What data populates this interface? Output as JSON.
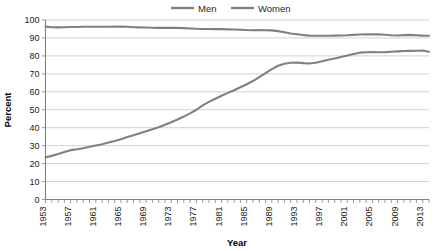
{
  "chart_data": {
    "type": "line",
    "title": "",
    "xlabel": "Year",
    "ylabel": "Percent",
    "xlim": [
      1953,
      2014
    ],
    "ylim": [
      0,
      100
    ],
    "grid": true,
    "legend_position": "top-center",
    "y_ticks": [
      0,
      10,
      20,
      30,
      40,
      50,
      60,
      70,
      80,
      90,
      100
    ],
    "x_tick_labels": [
      "1953",
      "1957",
      "1961",
      "1965",
      "1969",
      "1973",
      "1977",
      "1981",
      "1985",
      "1989",
      "1993",
      "1997",
      "2001",
      "2005",
      "2009",
      "2013"
    ],
    "x_tick_step": 4,
    "x_minor_tick_step": 1,
    "colors": {
      "men": "#808080",
      "women": "#808080",
      "gridline": "#bdbdbd",
      "axis": "#808080",
      "text": "#1a1a1a"
    },
    "x": [
      1953,
      1954,
      1955,
      1956,
      1957,
      1958,
      1959,
      1960,
      1961,
      1962,
      1963,
      1964,
      1965,
      1966,
      1967,
      1968,
      1969,
      1970,
      1971,
      1972,
      1973,
      1974,
      1975,
      1976,
      1977,
      1978,
      1979,
      1980,
      1981,
      1982,
      1983,
      1984,
      1985,
      1986,
      1987,
      1988,
      1989,
      1990,
      1991,
      1992,
      1993,
      1994,
      1995,
      1996,
      1997,
      1998,
      1999,
      2000,
      2001,
      2002,
      2003,
      2004,
      2005,
      2006,
      2007,
      2008,
      2009,
      2010,
      2011,
      2012,
      2013,
      2014
    ],
    "series": [
      {
        "name": "Men",
        "values": [
          96.3,
          96.0,
          95.9,
          96.0,
          96.1,
          96.1,
          96.2,
          96.2,
          96.2,
          96.2,
          96.2,
          96.3,
          96.3,
          96.2,
          96.0,
          95.9,
          95.8,
          95.7,
          95.6,
          95.6,
          95.6,
          95.6,
          95.5,
          95.3,
          95.1,
          95.0,
          95.0,
          94.9,
          94.9,
          94.8,
          94.7,
          94.6,
          94.4,
          94.3,
          94.4,
          94.3,
          94.2,
          93.8,
          93.2,
          92.5,
          92.1,
          91.6,
          91.3,
          91.2,
          91.2,
          91.2,
          91.3,
          91.4,
          91.5,
          91.7,
          91.9,
          92.0,
          92.1,
          92.0,
          91.8,
          91.5,
          91.4,
          91.6,
          91.7,
          91.5,
          91.3,
          91.2
        ]
      },
      {
        "name": "Women",
        "values": [
          23.5,
          24.3,
          25.3,
          26.4,
          27.5,
          28.0,
          28.6,
          29.4,
          30.1,
          30.8,
          31.7,
          32.6,
          33.6,
          34.8,
          35.8,
          36.9,
          38.0,
          39.2,
          40.3,
          41.6,
          43.0,
          44.6,
          46.2,
          48.0,
          50.0,
          52.4,
          54.4,
          56.1,
          57.8,
          59.4,
          60.9,
          62.5,
          64.2,
          66.0,
          68.2,
          70.4,
          72.6,
          74.5,
          75.6,
          76.2,
          76.3,
          76.0,
          75.8,
          76.2,
          77.0,
          77.8,
          78.6,
          79.4,
          80.2,
          81.1,
          81.8,
          82.0,
          82.1,
          82.0,
          82.1,
          82.3,
          82.5,
          82.7,
          82.8,
          82.9,
          83.0,
          82.3
        ]
      }
    ]
  },
  "legend": {
    "items": [
      {
        "label": "Men"
      },
      {
        "label": "Women"
      }
    ]
  },
  "axes": {
    "y_title": "Percent",
    "x_title": "Year"
  }
}
